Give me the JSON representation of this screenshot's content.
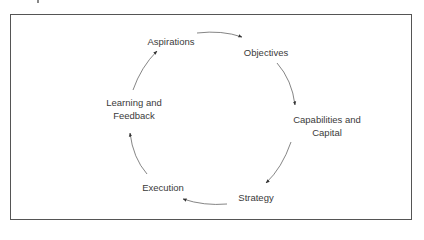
{
  "diagram": {
    "type": "cycle",
    "nodes": [
      {
        "id": "aspirations",
        "label": "Aspirations",
        "x": 171,
        "y": 41
      },
      {
        "id": "objectives",
        "label": "Objectives",
        "x": 266,
        "y": 52
      },
      {
        "id": "capabilities",
        "label_line1": "Capabilities and",
        "label_line2": "Capital",
        "x": 327,
        "y": 126
      },
      {
        "id": "strategy",
        "label": "Strategy",
        "x": 256,
        "y": 197
      },
      {
        "id": "execution",
        "label": "Execution",
        "x": 163,
        "y": 187
      },
      {
        "id": "learning",
        "label_line1": "Learning and",
        "label_line2": "Feedback",
        "x": 134,
        "y": 109
      }
    ],
    "edges": [
      {
        "from": "aspirations",
        "to": "objectives"
      },
      {
        "from": "objectives",
        "to": "capabilities"
      },
      {
        "from": "capabilities",
        "to": "strategy"
      },
      {
        "from": "strategy",
        "to": "execution"
      },
      {
        "from": "execution",
        "to": "learning"
      },
      {
        "from": "learning",
        "to": "aspirations"
      }
    ],
    "colors": {
      "line": "#555555",
      "text": "#3a3a3a",
      "frame": "#555555"
    }
  }
}
